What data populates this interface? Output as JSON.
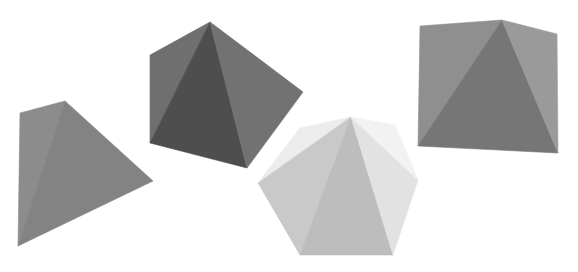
{
  "scene": {
    "description": "Four shaded gray pyramids on a white background",
    "background": "#ffffff",
    "shapes": [
      {
        "name": "square-pyramid-left",
        "faces": [
          {
            "points": "65,101 20,113 18,246",
            "fill": "#8c8c8c"
          },
          {
            "points": "65,101 18,246 153,181",
            "fill": "#838383"
          }
        ]
      },
      {
        "name": "pentagonal-pyramid-dark",
        "faces": [
          {
            "points": "210,22 150,55 150,143",
            "fill": "#6f6f6f"
          },
          {
            "points": "210,22 150,143 247,168",
            "fill": "#4e4e4e"
          },
          {
            "points": "210,22 247,168 303,92",
            "fill": "#727272"
          }
        ]
      },
      {
        "name": "hexagonal-pyramid-light",
        "faces": [
          {
            "points": "351,117 300,128 258,183",
            "fill": "#ececec"
          },
          {
            "points": "351,117 258,183 300,255",
            "fill": "#c9c9c9"
          },
          {
            "points": "351,117 300,255 393,255",
            "fill": "#bdbdbd"
          },
          {
            "points": "351,117 393,255 418,180",
            "fill": "#e2e2e2"
          },
          {
            "points": "351,117 418,180 395,125",
            "fill": "#f2f2f2"
          }
        ]
      },
      {
        "name": "square-pyramid-right",
        "faces": [
          {
            "points": "502,20 420,26 418,146",
            "fill": "#8f8f8f"
          },
          {
            "points": "502,20 418,146 558,153",
            "fill": "#767676"
          },
          {
            "points": "502,20 558,153 557,34",
            "fill": "#9a9a9a"
          }
        ]
      }
    ]
  }
}
